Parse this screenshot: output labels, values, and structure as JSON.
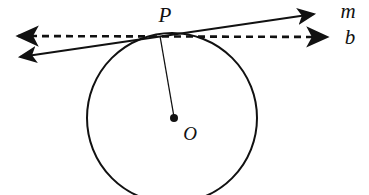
{
  "figure": {
    "background_color": "#ffffff",
    "stroke_color": "#111111",
    "width": 369,
    "height": 195
  },
  "labels": {
    "point_p": "P",
    "line_m": "m",
    "line_b": "b",
    "center_o": "O"
  },
  "geometry": {
    "circle": {
      "center_x": 172,
      "center_y": 118,
      "radius": 85,
      "stroke_width": 2
    },
    "center_dot": {
      "cx": 174,
      "cy": 118,
      "r": 4
    },
    "tangent_point": {
      "x": 160,
      "y": 36
    },
    "line_m": {
      "x1": 13,
      "y1": 58,
      "x2": 320,
      "y2": 13,
      "style": "solid",
      "arrows": "both"
    },
    "line_b": {
      "x1": 12,
      "y1": 36,
      "x2": 333,
      "y2": 37,
      "style": "dashed",
      "arrows": "both",
      "dash_pattern": "7 5"
    },
    "radius_segment": {
      "x1": 160,
      "y1": 36,
      "x2": 174,
      "y2": 117,
      "stroke_width": 1
    }
  },
  "label_positions": {
    "point_p": {
      "x": 165,
      "y": 22
    },
    "line_m": {
      "x": 348,
      "y": 18
    },
    "line_b": {
      "x": 350,
      "y": 44
    },
    "center_o": {
      "x": 190,
      "y": 140
    }
  }
}
